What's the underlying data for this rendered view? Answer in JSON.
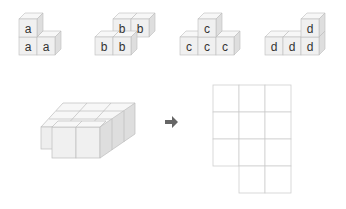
{
  "figures": [
    {
      "name": "figure-a",
      "letter": "a"
    },
    {
      "name": "figure-b",
      "letter": "b"
    },
    {
      "name": "figure-c",
      "letter": "c"
    },
    {
      "name": "figure-d",
      "letter": "d"
    }
  ],
  "labels": {
    "a1": "a",
    "a2": "a",
    "a3": "a",
    "b1": "b",
    "b2": "b",
    "b3": "b",
    "b4": "b",
    "c1": "c",
    "c2": "c",
    "c3": "c",
    "c4": "c",
    "d1": "d",
    "d2": "d",
    "d3": "d",
    "d4": "d"
  },
  "puzzle": {
    "arrow": "right-arrow",
    "grid": {
      "columns": 3,
      "rows": 4,
      "missing_cells": [
        "row4-col1"
      ]
    },
    "colors": {
      "cube_front": "#f0f0f0",
      "cube_top": "#f7f7f7",
      "cube_side": "#dedede",
      "edge": "#bdbdbd",
      "arrow": "#666666",
      "grid_line": "#cfcfcf"
    }
  }
}
